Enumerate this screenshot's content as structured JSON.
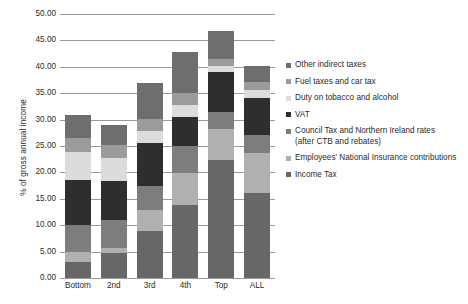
{
  "chart_data": {
    "type": "bar",
    "stacked": true,
    "title": "",
    "xlabel": "",
    "ylabel": "% of gross annual income",
    "ylim": [
      0,
      50
    ],
    "ytick_labels": [
      "50.00",
      "45.00",
      "40.00",
      "35.00",
      "30.00",
      "25.00",
      "20.00",
      "15.00",
      "10.00",
      "5.00",
      "0.00"
    ],
    "ytick_values": [
      50,
      45,
      40,
      35,
      30,
      25,
      20,
      15,
      10,
      5,
      0
    ],
    "grid": true,
    "legend_position": "right",
    "categories": [
      "Bottom",
      "2nd",
      "3rd",
      "4th",
      "Top",
      "ALL"
    ],
    "series": [
      {
        "name": "Income Tax",
        "color": "#676767",
        "values": [
          3.0,
          4.7,
          8.9,
          13.8,
          22.4,
          16.1
        ]
      },
      {
        "name": "Employees' National Insurance contributions",
        "color": "#b0b0b0",
        "values": [
          2.0,
          1.0,
          4.0,
          6.1,
          5.8,
          7.6
        ]
      },
      {
        "name": "Council Tax and Northern Ireland rates\n(after CTB and rebates)",
        "color": "#7d7d7d",
        "values": [
          5.0,
          5.3,
          4.5,
          5.1,
          3.3,
          3.4
        ]
      },
      {
        "name": "VAT",
        "color": "#2e2e2e",
        "values": [
          8.5,
          7.4,
          8.1,
          5.5,
          7.5,
          7.0
        ]
      },
      {
        "name": "Duty on tobacco and alcohol",
        "color": "#dcdcdc",
        "values": [
          5.3,
          4.3,
          2.3,
          2.3,
          1.2,
          1.5
        ]
      },
      {
        "name": "Fuel taxes and car tax",
        "color": "#9b9b9b",
        "values": [
          2.8,
          2.5,
          2.4,
          2.2,
          1.2,
          1.5
        ]
      },
      {
        "name": "Other indirect taxes",
        "color": "#6e6e6e",
        "values": [
          4.2,
          3.8,
          6.8,
          7.8,
          5.4,
          3.1
        ]
      }
    ],
    "totals": [
      30.8,
      29.0,
      37.0,
      42.8,
      46.8,
      40.2
    ]
  },
  "legend": {
    "items": [
      {
        "label": "Other indirect taxes",
        "color": "#6e6e6e"
      },
      {
        "label": "Fuel taxes and car tax",
        "color": "#9b9b9b"
      },
      {
        "label": "Duty on tobacco and alcohol",
        "color": "#dcdcdc"
      },
      {
        "label": "VAT",
        "color": "#2e2e2e"
      },
      {
        "label": "Council Tax and Northern Ireland rates\n(after CTB and rebates)",
        "color": "#7d7d7d"
      },
      {
        "label": "Employees' National Insurance contributions",
        "color": "#b0b0b0"
      },
      {
        "label": "Income Tax",
        "color": "#676767"
      }
    ]
  },
  "axis": {
    "y_title": "% of gross annual income"
  }
}
